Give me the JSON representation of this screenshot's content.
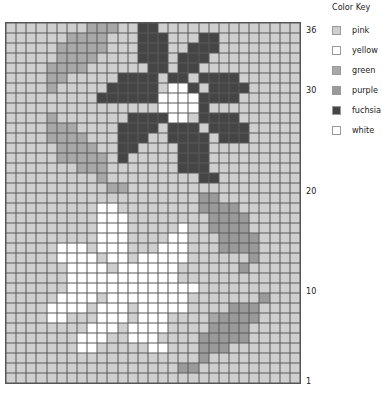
{
  "legend": {
    "title": "Color Key",
    "items": [
      {
        "key": "p",
        "label": "pink",
        "color": "#cfcfcf"
      },
      {
        "key": "y",
        "label": "yellow",
        "color": "#ffffff"
      },
      {
        "key": "g",
        "label": "green",
        "color": "#a8a8a8"
      },
      {
        "key": "u",
        "label": "purple",
        "color": "#9a9a9a"
      },
      {
        "key": "f",
        "label": "fuchsia",
        "color": "#454545"
      },
      {
        "key": "w",
        "label": "white",
        "color": "#ffffff"
      }
    ]
  },
  "row_labels": [
    {
      "text": "36",
      "row": 36
    },
    {
      "text": "30",
      "row": 30
    },
    {
      "text": "20",
      "row": 20
    },
    {
      "text": "10",
      "row": 10
    },
    {
      "text": "1",
      "row": 1
    }
  ],
  "grid": {
    "cols": 29,
    "rows": 36,
    "default": "p",
    "cells": [
      "ppppppppgggppffpppppppppppppp",
      "ppppppggggpppfffpppffpppppppp",
      "pppppgggggpppfffppfffpppppppp",
      "pppppggggppppfffpfffppppppppp",
      "ppppggggppppppffpffpppppppppp",
      "ppppggpppppffffpffpffffpppppp",
      "ppppgpppppfffffpwwfpffffppppp",
      "pppppppppffffffwwwwffffpppppp",
      "pppppppppppppppwwwwfppppppppp",
      "ppppgpppppppffffwwpffffpppppp",
      "ppppgggppppffffpfffpffffppppp",
      "ppppggggpppfffppffffpfffppppp",
      "pppppggggppffppppfffppppppppp",
      "pppppgggggpfpppppfffppppppppp",
      "pppppppgggpppppppfffppppppppp",
      "pppppppppgpppppppppffpppppppp",
      "ppppppppppggppppppppppppppppp",
      "pppppppppppppppppppuupppppppp",
      "pppppppppwwppppppppuuuupppppp",
      "pppppppppwwwppppppppuuuuppppp",
      "pppppppppwwwpppppwppuuuuppppp",
      "pppppppppwwwppppwwpppuuuupppp",
      "pppppwwwpwwwpppwwwpppuuuupppp",
      "pppppwwwwpwwpwwwwwppppppupppp",
      "ppppppwwwwpwwwwwwppppppupppp",
      "ppppppwwwwwwwwwwwpppppppppppp",
      "ppppppwwwwwwwwwwwwwpppppppppp",
      "pppppwwwwpwwwwwwwwpppppppuppp",
      "ppppwwwwpwwwpwwwwwppppuuupppp",
      "ppppwwpppwwwpwwwppppguuuupppp",
      "ppppppppwwwpwwwwppppuuuuppppp",
      "pppppppwwwppwwwppppuuuuuppppp",
      "pppppppwwpppppwwpppuuuppppppp",
      "pppppppppppppppppppuppppppppp",
      "pppppppppppppppppuupppppppppp",
      "ppppppppppppppppppppppppppppp"
    ]
  }
}
